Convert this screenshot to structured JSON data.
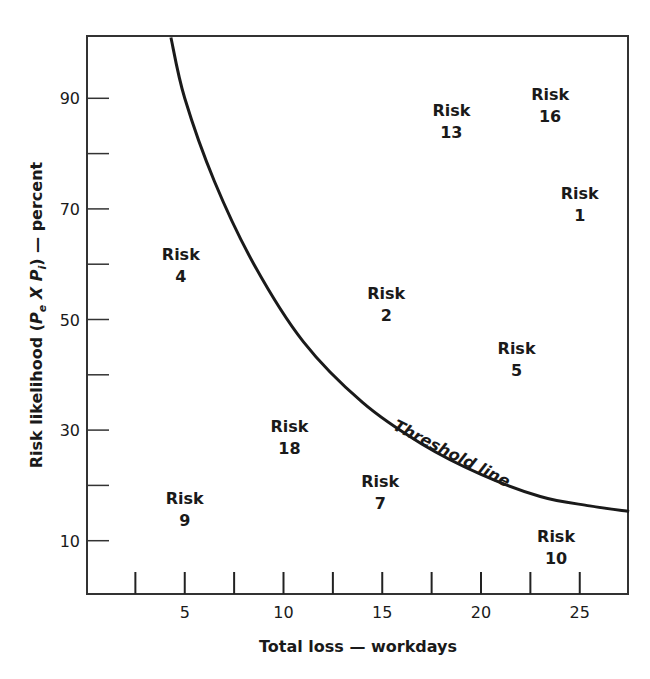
{
  "chart_data": {
    "type": "scatter",
    "title": "",
    "xlabel": "Total loss — workdays",
    "ylabel": "Risk likelihood (Pe X Pi) — percent",
    "ylabel_parts": {
      "prefix": "Risk likelihood (",
      "p1": "P",
      "sub1": "e",
      "mid": " X ",
      "p2": "P",
      "sub2": "i",
      "suffix": ") — percent"
    },
    "xlim": [
      0,
      27.5
    ],
    "ylim": [
      0,
      101
    ],
    "x_major_ticks": [
      5,
      10,
      15,
      20,
      25
    ],
    "x_minor_ticks": [
      2.5,
      7.5,
      12.5,
      17.5,
      22.5
    ],
    "y_major_ticks": [
      10,
      30,
      50,
      70,
      90
    ],
    "y_minor_ticks": [
      20,
      40,
      60,
      80
    ],
    "grid": false,
    "points": [
      {
        "label": "Risk",
        "id": "16",
        "x": 23.5,
        "y": 89
      },
      {
        "label": "Risk",
        "id": "13",
        "x": 18.5,
        "y": 86
      },
      {
        "label": "Risk",
        "id": "1",
        "x": 25,
        "y": 71
      },
      {
        "label": "Risk",
        "id": "4",
        "x": 4.8,
        "y": 60
      },
      {
        "label": "Risk",
        "id": "2",
        "x": 15.2,
        "y": 53
      },
      {
        "label": "Risk",
        "id": "5",
        "x": 21.8,
        "y": 43
      },
      {
        "label": "Risk",
        "id": "18",
        "x": 10.3,
        "y": 29
      },
      {
        "label": "Risk",
        "id": "7",
        "x": 14.9,
        "y": 19
      },
      {
        "label": "Risk",
        "id": "9",
        "x": 5,
        "y": 16
      },
      {
        "label": "Risk",
        "id": "10",
        "x": 23.8,
        "y": 9
      }
    ],
    "threshold_line": {
      "label": "Threshold line",
      "points": [
        [
          4.3,
          101
        ],
        [
          5,
          90
        ],
        [
          6.5,
          75
        ],
        [
          8.5,
          60
        ],
        [
          11,
          46
        ],
        [
          14,
          35
        ],
        [
          17,
          27.5
        ],
        [
          20,
          22
        ],
        [
          23,
          18
        ],
        [
          25.5,
          16.3
        ],
        [
          27.5,
          15.3
        ]
      ]
    }
  },
  "colors": {
    "ink": "#1a1a1a",
    "background": "#ffffff"
  }
}
